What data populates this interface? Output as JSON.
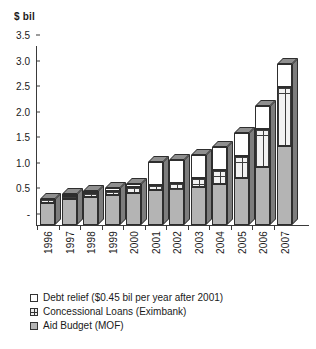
{
  "chart_data": {
    "type": "bar",
    "stacked": true,
    "title": "",
    "ylabel": "$ bil",
    "xlabel": "",
    "ylim": [
      0,
      3.5
    ],
    "yticks": [
      "-",
      "0.5",
      "1.0",
      "1.5",
      "2.0",
      "2.5",
      "3.0",
      "3.5"
    ],
    "ytick_values": [
      0,
      0.5,
      1.0,
      1.5,
      2.0,
      2.5,
      3.0,
      3.5
    ],
    "grid": false,
    "legend_position": "bottom-left",
    "categories": [
      "1996",
      "1997",
      "1998",
      "1999",
      "2000",
      "2001",
      "2002",
      "2003",
      "2004",
      "2005",
      "2006",
      "2007"
    ],
    "series": [
      {
        "name": "Aid Budget (MOF)",
        "key": "aid",
        "color": "#b4b4b4",
        "values": [
          0.44,
          0.5,
          0.54,
          0.58,
          0.63,
          0.68,
          0.7,
          0.74,
          0.8,
          0.92,
          1.14,
          1.55
        ]
      },
      {
        "name": "Concessional Loans (Eximbank)",
        "key": "loan",
        "color": "#f2f2f2",
        "values": [
          0.06,
          0.07,
          0.08,
          0.09,
          0.11,
          0.11,
          0.13,
          0.17,
          0.27,
          0.43,
          0.74,
          1.15
        ]
      },
      {
        "name": "Debt relief ($0.45 bil per year after 2001)",
        "key": "debt",
        "color": "#ffffff",
        "values": [
          0.0,
          0.03,
          0.04,
          0.05,
          0.06,
          0.45,
          0.45,
          0.45,
          0.45,
          0.45,
          0.45,
          0.45
        ]
      }
    ],
    "totals": [
      0.5,
      0.6,
      0.66,
      0.72,
      0.8,
      1.24,
      1.28,
      1.36,
      1.52,
      1.8,
      2.33,
      3.15
    ]
  },
  "legend": {
    "items": [
      {
        "label": "Debt relief ($0.45 bil per year after 2001)",
        "key": "debt"
      },
      {
        "label": "Concessional Loans (Eximbank)",
        "key": "loan"
      },
      {
        "label": "Aid Budget (MOF)",
        "key": "aid"
      }
    ]
  }
}
